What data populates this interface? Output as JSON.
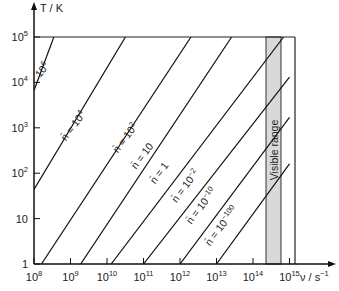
{
  "chart_data": {
    "type": "line",
    "title": "",
    "xlabel": "ν / s⁻¹",
    "ylabel": "T / K",
    "xscale": "log",
    "yscale": "log",
    "xlim": [
      100000000.0,
      1000000000000000.0
    ],
    "ylim": [
      1,
      100000.0
    ],
    "x_ticks": [
      "10^8",
      "10^9",
      "10^10",
      "10^11",
      "10^12",
      "10^13",
      "10^14",
      "10^15"
    ],
    "y_ticks": [
      "1",
      "10",
      "10^2",
      "10^3",
      "10^4",
      "10^5"
    ],
    "grid": false,
    "visible_range": {
      "label": "Visible range",
      "x_start": 400000000000000.0,
      "x_end": 750000000000000.0,
      "color": "#d9d9d9"
    },
    "series": [
      {
        "name": "10^6",
        "label_text": "10",
        "label_sup": "6",
        "points": [
          [
            100000000.0,
            6600.0
          ],
          [
            350000000.0,
            100000.0
          ]
        ]
      },
      {
        "name": "n̄ = 10^4",
        "label_text": "n = 10",
        "label_sup": "4",
        "points": [
          [
            100000000.0,
            44
          ],
          [
            32000000000.0,
            100000.0
          ]
        ]
      },
      {
        "name": "n̄ = 10^2",
        "label_text": "n = 10",
        "label_sup": "2",
        "points": [
          [
            160000000.0,
            1
          ],
          [
            2000000000000.0,
            100000.0
          ]
        ]
      },
      {
        "name": "n̄ = 10",
        "label_text": "n = 10",
        "label_sup": "",
        "points": [
          [
            1900000000.0,
            1
          ],
          [
            26000000000000.0,
            100000.0
          ]
        ]
      },
      {
        "name": "n̄ = 1",
        "label_text": "n = 1",
        "label_sup": "",
        "points": [
          [
            13000000000.0,
            1
          ],
          [
            690000000000000.0,
            100000.0
          ]
        ]
      },
      {
        "name": "n̄ = 10^-2",
        "label_text": "n = 10",
        "label_sup": "−2",
        "points": [
          [
            100000000000.0,
            1
          ],
          [
            1000000000000000.0,
            13000.0
          ]
        ]
      },
      {
        "name": "n̄ = 10^-10",
        "label_text": "n = 10",
        "label_sup": "−10",
        "points": [
          [
            1000000000000.0,
            1
          ],
          [
            1000000000000000.0,
            1700.0
          ]
        ]
      },
      {
        "name": "n̄ = 10^-100",
        "label_text": "n = 10",
        "label_sup": "−100",
        "points": [
          [
            10000000000000.0,
            1
          ],
          [
            1000000000000000.0,
            160.0
          ]
        ]
      }
    ]
  },
  "labels": {
    "y_axis": "T / K",
    "x_axis": "ν / s",
    "x_axis_sup": "−1",
    "visible_range": "Visible range"
  }
}
